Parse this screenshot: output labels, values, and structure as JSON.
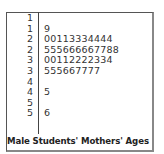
{
  "chart_data": {
    "type": "table",
    "subtype": "stem-and-leaf",
    "title": "Male Students' Mothers' Ages",
    "stem_unit": "tens",
    "leaf_unit": "ones",
    "rows": [
      {
        "stem": "1",
        "leaves": ""
      },
      {
        "stem": "1",
        "leaves": "9"
      },
      {
        "stem": "2",
        "leaves": "00113334444"
      },
      {
        "stem": "2",
        "leaves": "555666667788"
      },
      {
        "stem": "3",
        "leaves": "00112222334"
      },
      {
        "stem": "3",
        "leaves": "555667777"
      },
      {
        "stem": "4",
        "leaves": ""
      },
      {
        "stem": "4",
        "leaves": "5"
      },
      {
        "stem": "5",
        "leaves": ""
      },
      {
        "stem": "5",
        "leaves": "6"
      }
    ],
    "values": [
      19,
      20,
      20,
      21,
      21,
      23,
      23,
      23,
      24,
      24,
      24,
      24,
      25,
      25,
      25,
      26,
      26,
      26,
      26,
      26,
      27,
      27,
      28,
      28,
      30,
      30,
      31,
      31,
      32,
      32,
      32,
      32,
      33,
      34,
      35,
      35,
      35,
      36,
      36,
      37,
      37,
      37,
      37,
      45,
      56
    ]
  }
}
